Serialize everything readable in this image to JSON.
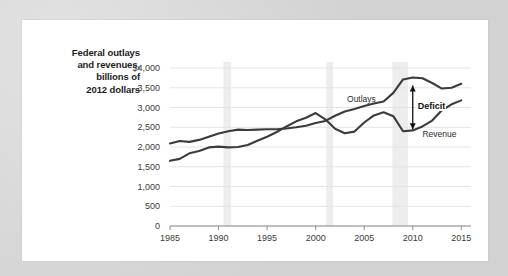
{
  "figure": {
    "background_color": "#d8d8d8",
    "card_color": "#ffffff"
  },
  "chart_data": {
    "type": "line",
    "title": "",
    "xlabel": "",
    "ylabel": "Federal outlays and revenues, billions of 2012 dollars",
    "ylabel_lines": [
      "Federal outlays",
      "and revenues,",
      "billions of",
      "2012 dollars"
    ],
    "xlim": [
      1985,
      2016
    ],
    "ylim": [
      0,
      4000
    ],
    "grid": true,
    "grid_color": "#e4e4e4",
    "legend_position": "inline-labels",
    "yticks": [
      0,
      500,
      1000,
      1500,
      2000,
      2500,
      3000,
      3500,
      4000
    ],
    "ytick_labels": [
      "0",
      "500",
      "1,000",
      "1,500",
      "2,000",
      "2,500",
      "3,000",
      "3,500",
      "$4,000"
    ],
    "xticks": [
      1985,
      1990,
      1995,
      2000,
      2005,
      2010,
      2015
    ],
    "xtick_labels": [
      "1985",
      "1990",
      "1995",
      "2000",
      "2005",
      "2010",
      "2015"
    ],
    "line_color": "#3b3b3b",
    "x": [
      1985,
      1986,
      1987,
      1988,
      1989,
      1990,
      1991,
      1992,
      1993,
      1994,
      1995,
      1996,
      1997,
      1998,
      1999,
      2000,
      2001,
      2002,
      2003,
      2004,
      2005,
      2006,
      2007,
      2008,
      2009,
      2010,
      2011,
      2012,
      2013,
      2014,
      2015
    ],
    "series": [
      {
        "name": "Outlays",
        "label": "Outlays",
        "values": [
          2090,
          2150,
          2130,
          2180,
          2260,
          2340,
          2400,
          2440,
          2430,
          2440,
          2450,
          2450,
          2470,
          2500,
          2540,
          2610,
          2660,
          2790,
          2900,
          2960,
          3040,
          3100,
          3150,
          3370,
          3710,
          3760,
          3740,
          3620,
          3480,
          3500,
          3600
        ]
      },
      {
        "name": "Revenue",
        "label": "Revenue",
        "values": [
          1650,
          1700,
          1840,
          1900,
          1990,
          2010,
          1990,
          2000,
          2050,
          2160,
          2260,
          2380,
          2520,
          2650,
          2740,
          2860,
          2700,
          2460,
          2350,
          2390,
          2620,
          2800,
          2880,
          2780,
          2400,
          2420,
          2520,
          2670,
          2930,
          3080,
          3180
        ]
      }
    ],
    "annotations": [
      {
        "name": "deficit",
        "label": "Deficit",
        "type": "double-arrow",
        "x": 2010,
        "y_top": 3560,
        "y_bottom": 2450
      }
    ],
    "shaded_bands": [
      {
        "name": "recession-1990",
        "x_start": 1990.5,
        "x_end": 1991.3,
        "color": "#ededed"
      },
      {
        "name": "recession-2001",
        "x_start": 2001.1,
        "x_end": 2001.8,
        "color": "#ededed"
      },
      {
        "name": "recession-2008",
        "x_start": 2007.9,
        "x_end": 2009.5,
        "color": "#ededed"
      }
    ]
  }
}
